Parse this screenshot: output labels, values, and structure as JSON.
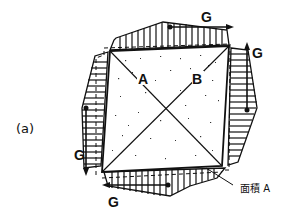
{
  "figure": {
    "panel_label": "(a)",
    "square_label_A": "A",
    "square_label_B": "B",
    "force_labels": {
      "top": "G",
      "right": "G",
      "left": "G",
      "bottom": "G"
    },
    "area_callout": "面積 A",
    "colors": {
      "line": "#111111",
      "background": "#ffffff",
      "stipple": "#333333"
    }
  }
}
